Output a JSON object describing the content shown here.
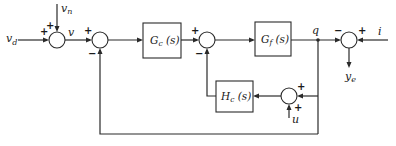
{
  "diagram": {
    "type": "control-system-block-diagram",
    "signals": {
      "v_d": "v",
      "v_d_sub": "d",
      "v_n": "v",
      "v_n_sub": "n",
      "v": "v",
      "q": "q",
      "i": "i",
      "y_e": "y",
      "y_e_sub": "e",
      "u": "u"
    },
    "blocks": {
      "gc": {
        "main": "G",
        "sub": "c",
        "arg": " (s)"
      },
      "gf": {
        "main": "G",
        "sub": "f",
        "arg": " (s)"
      },
      "hc": {
        "main": "H",
        "sub": "c",
        "arg": " (s)"
      }
    },
    "summing_junctions": {
      "sum1": {
        "signs": [
          "+",
          "+"
        ]
      },
      "sum2": {
        "signs": [
          "+",
          "−"
        ]
      },
      "sum3": {
        "signs": [
          "+",
          "−"
        ]
      },
      "sum4": {
        "signs": [
          "−",
          "+"
        ]
      },
      "sum5": {
        "signs": [
          "+",
          "+"
        ]
      }
    }
  }
}
